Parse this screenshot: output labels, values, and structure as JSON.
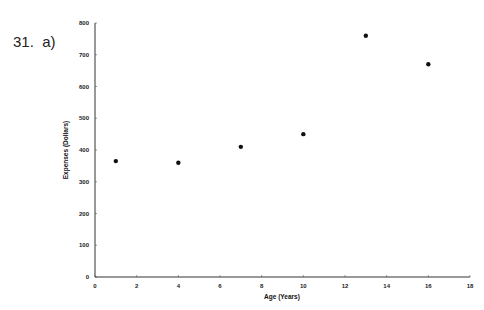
{
  "problem": {
    "label": "31.  a)"
  },
  "chart_data": {
    "type": "scatter",
    "title": "",
    "xlabel": "Age (Years)",
    "ylabel": "Expenses (Dollars)",
    "xlim": [
      0,
      18
    ],
    "ylim": [
      0,
      800
    ],
    "xticks": [
      0,
      2,
      4,
      6,
      8,
      10,
      12,
      14,
      16,
      18
    ],
    "yticks": [
      0,
      100,
      200,
      300,
      400,
      500,
      600,
      700,
      800
    ],
    "grid": false,
    "legend": null,
    "series": [
      {
        "name": "Expenses",
        "color": "#111111",
        "points": [
          {
            "x": 1,
            "y": 365
          },
          {
            "x": 4,
            "y": 360
          },
          {
            "x": 7,
            "y": 410
          },
          {
            "x": 10,
            "y": 450
          },
          {
            "x": 13,
            "y": 760
          },
          {
            "x": 16,
            "y": 670
          }
        ]
      }
    ]
  }
}
